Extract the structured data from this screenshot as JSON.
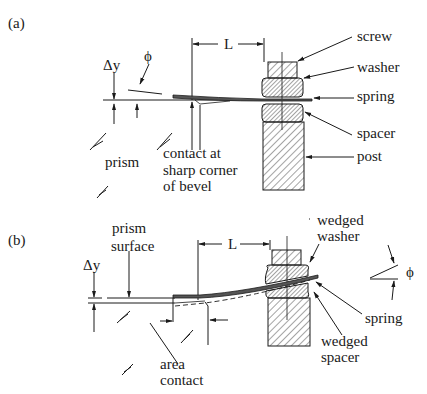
{
  "figure": {
    "panel_a": {
      "label": "(a)",
      "dims": {
        "delta_y": "Δy",
        "phi": "ϕ",
        "L": "L"
      },
      "callouts": {
        "screw": "screw",
        "washer": "washer",
        "spring": "spring",
        "spacer": "spacer",
        "post": "post",
        "prism": "prism",
        "contact_line1": "contact at",
        "contact_line2": "sharp corner",
        "contact_line3": "of bevel"
      }
    },
    "panel_b": {
      "label": "(b)",
      "dims": {
        "delta_y": "Δy",
        "phi": "ϕ",
        "L": "L"
      },
      "callouts": {
        "prism_surface_line1": "prism",
        "prism_surface_line2": "surface",
        "wedged_washer_line1": "wedged",
        "wedged_washer_line2": "washer",
        "spring": "spring",
        "wedged_spacer_line1": "wedged",
        "wedged_spacer_line2": "spacer",
        "area_contact_line1": "area",
        "area_contact_line2": "contact"
      }
    },
    "colors": {
      "ink": "#1a1a1a",
      "background": "#ffffff"
    }
  }
}
